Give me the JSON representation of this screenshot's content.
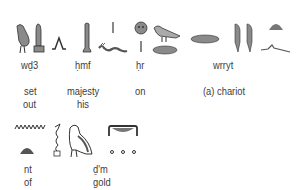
{
  "row1": {
    "words": [
      {
        "translit": "wḏ3",
        "gloss": [
          "set",
          "out"
        ]
      },
      {
        "translit": "ḥmf",
        "gloss": [
          "majesty",
          "his"
        ]
      },
      {
        "translit": "ḥr",
        "gloss": [
          "on"
        ]
      },
      {
        "translit": "wrryt",
        "gloss": [
          "(a) chariot"
        ]
      }
    ]
  },
  "row2": {
    "words": [
      {
        "translit": "nt",
        "gloss": [
          "of"
        ]
      },
      {
        "translit": "ḏ'm",
        "gloss": [
          "gold"
        ]
      }
    ]
  },
  "colors": {
    "glyph_fill": "#8a8a8a",
    "glyph_stroke": "#333333",
    "text": "#3d3d3d"
  }
}
